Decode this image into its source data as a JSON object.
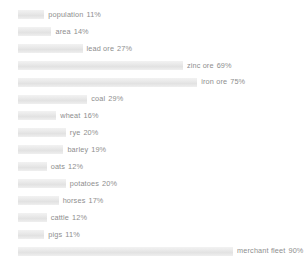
{
  "chart_data": {
    "type": "bar",
    "orientation": "horizontal",
    "title": "",
    "xlabel": "",
    "ylabel": "",
    "xlim": [
      0,
      100
    ],
    "grid": false,
    "legend": false,
    "unit": "%",
    "categories": [
      "population",
      "area",
      "lead ore",
      "zinc ore",
      "iron ore",
      "coal",
      "wheat",
      "rye",
      "barley",
      "oats",
      "potatoes",
      "horses",
      "cattle",
      "pigs",
      "merchant fleet"
    ],
    "values": [
      11,
      14,
      27,
      69,
      75,
      29,
      16,
      20,
      19,
      12,
      20,
      17,
      12,
      11,
      90
    ],
    "bar_color": "#ebebeb",
    "label_color": "#8e8e8e"
  },
  "rows": [
    {
      "name": "population",
      "value": 11,
      "label": "population",
      "pct": "11%"
    },
    {
      "name": "area",
      "value": 14,
      "label": "area",
      "pct": "14%"
    },
    {
      "name": "lead-ore",
      "value": 27,
      "label": "lead ore",
      "pct": "27%"
    },
    {
      "name": "zinc-ore",
      "value": 69,
      "label": "zinc ore",
      "pct": "69%"
    },
    {
      "name": "iron-ore",
      "value": 75,
      "label": "iron ore",
      "pct": "75%"
    },
    {
      "name": "coal",
      "value": 29,
      "label": "coal",
      "pct": "29%"
    },
    {
      "name": "wheat",
      "value": 16,
      "label": "wheat",
      "pct": "16%"
    },
    {
      "name": "rye",
      "value": 20,
      "label": "rye",
      "pct": "20%"
    },
    {
      "name": "barley",
      "value": 19,
      "label": "barley",
      "pct": "19%"
    },
    {
      "name": "oats",
      "value": 12,
      "label": "oats",
      "pct": "12%"
    },
    {
      "name": "potatoes",
      "value": 20,
      "label": "potatoes",
      "pct": "20%"
    },
    {
      "name": "horses",
      "value": 17,
      "label": "horses",
      "pct": "17%"
    },
    {
      "name": "cattle",
      "value": 12,
      "label": "cattle",
      "pct": "12%"
    },
    {
      "name": "pigs",
      "value": 11,
      "label": "pigs",
      "pct": "11%"
    },
    {
      "name": "merchant-fleet",
      "value": 90,
      "label": "merchant fleet",
      "pct": "90%"
    }
  ],
  "layout": {
    "bar_start_x": 18,
    "row_top_first": 8,
    "row_step": 16.9,
    "scale_px_per_pct": 2.39
  }
}
